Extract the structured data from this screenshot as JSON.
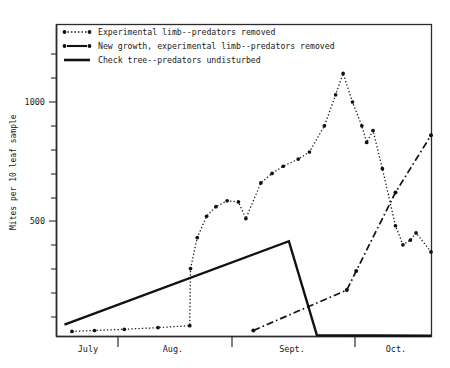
{
  "chart_data": {
    "type": "line",
    "title": "",
    "xlabel": "",
    "ylabel": "Mites per 10 leaf sample",
    "ylim": [
      0,
      1210
    ],
    "yticks": [
      500,
      1000
    ],
    "ytick_labels": [
      "500",
      "1000"
    ],
    "minor_ticks": true,
    "grid": false,
    "legend_position": "top-left",
    "x_category_labels": [
      "July",
      "Aug.",
      "Sept.",
      "Oct."
    ],
    "series": [
      {
        "name": "Experimental limb--predators removed",
        "style": "dotted",
        "marker": "filled-circle",
        "points": [
          {
            "x": 0.04,
            "y": 36
          },
          {
            "x": 0.1,
            "y": 40
          },
          {
            "x": 0.18,
            "y": 45
          },
          {
            "x": 0.27,
            "y": 52
          },
          {
            "x": 0.355,
            "y": 60
          },
          {
            "x": 0.357,
            "y": 300
          },
          {
            "x": 0.375,
            "y": 430
          },
          {
            "x": 0.4,
            "y": 520
          },
          {
            "x": 0.425,
            "y": 560
          },
          {
            "x": 0.455,
            "y": 585
          },
          {
            "x": 0.485,
            "y": 580
          },
          {
            "x": 0.505,
            "y": 510
          },
          {
            "x": 0.545,
            "y": 660
          },
          {
            "x": 0.575,
            "y": 700
          },
          {
            "x": 0.605,
            "y": 730
          },
          {
            "x": 0.645,
            "y": 760
          },
          {
            "x": 0.675,
            "y": 790
          },
          {
            "x": 0.715,
            "y": 900
          },
          {
            "x": 0.745,
            "y": 1030
          },
          {
            "x": 0.765,
            "y": 1120
          },
          {
            "x": 0.79,
            "y": 1000
          },
          {
            "x": 0.815,
            "y": 900
          },
          {
            "x": 0.828,
            "y": 830
          },
          {
            "x": 0.845,
            "y": 880
          },
          {
            "x": 0.87,
            "y": 720
          },
          {
            "x": 0.905,
            "y": 480
          },
          {
            "x": 0.925,
            "y": 400
          },
          {
            "x": 0.945,
            "y": 420
          },
          {
            "x": 0.96,
            "y": 450
          },
          {
            "x": 1.0,
            "y": 370
          }
        ]
      },
      {
        "name": "New growth, experimental limb--predators removed",
        "style": "dash-dot",
        "marker": "filled-circle",
        "points": [
          {
            "x": 0.525,
            "y": 40
          },
          {
            "x": 0.775,
            "y": 210
          },
          {
            "x": 0.8,
            "y": 290
          },
          {
            "x": 0.905,
            "y": 620
          },
          {
            "x": 1.0,
            "y": 860
          }
        ]
      },
      {
        "name": "Check tree--predators undisturbed",
        "style": "solid",
        "marker": "none",
        "points": [
          {
            "x": 0.02,
            "y": 65
          },
          {
            "x": 0.62,
            "y": 415
          },
          {
            "x": 0.695,
            "y": 20
          },
          {
            "x": 1.0,
            "y": 18
          }
        ]
      }
    ]
  },
  "legend": {
    "entries": [
      {
        "label": "Experimental limb--predators removed",
        "style": "dotted"
      },
      {
        "label": "New growth, experimental limb--predators removed",
        "style": "dash-dot"
      },
      {
        "label": "Check tree--predators undisturbed",
        "style": "solid"
      }
    ]
  },
  "axes": {
    "y_title": "Mites per 10 leaf sample",
    "y_labels": [
      "1000",
      "500"
    ],
    "x_labels": [
      "July",
      "Aug.",
      "Sept.",
      "Oct."
    ]
  },
  "colors": {
    "ink": "#111111",
    "background": "#ffffff"
  }
}
